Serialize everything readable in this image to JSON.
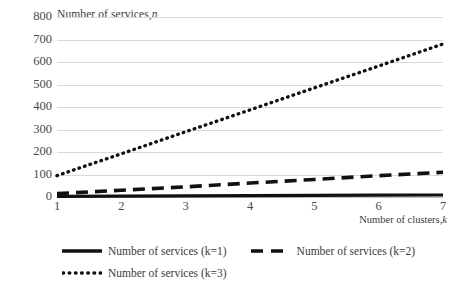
{
  "chart_data": {
    "type": "line",
    "title_plain": "Number of services,",
    "title_italic": "n",
    "xlabel_plain": "Number of clusters,",
    "xlabel_italic": "k",
    "xlabel": "Number of clusters, k",
    "ylabel": "Number of services, n",
    "x": [
      1,
      2,
      3,
      4,
      5,
      6,
      7
    ],
    "xticks": [
      "1",
      "2",
      "3",
      "4",
      "5",
      "6",
      "7"
    ],
    "yticks": [
      "0",
      "100",
      "200",
      "300",
      "400",
      "500",
      "600",
      "700",
      "800"
    ],
    "ytick_values": [
      0,
      100,
      200,
      300,
      400,
      500,
      600,
      700,
      800
    ],
    "ylim": [
      0,
      800
    ],
    "xlim": [
      1,
      7
    ],
    "grid": true,
    "legend_position": "bottom",
    "series": [
      {
        "name": "Number of services (k=1)",
        "style": "solid",
        "color": "#000000",
        "values": [
          3,
          4,
          5,
          6,
          7,
          8,
          9
        ]
      },
      {
        "name": "Number of services (k=2)",
        "style": "dashed",
        "color": "#000000",
        "values": [
          15,
          30,
          45,
          62,
          78,
          95,
          110
        ]
      },
      {
        "name": "Number of services (k=3)",
        "style": "dotted",
        "color": "#000000",
        "values": [
          95,
          192,
          290,
          387,
          485,
          582,
          680
        ]
      }
    ]
  },
  "legend": {
    "rows": [
      [
        "Number of services (k=1)",
        "Number of services (k=2)"
      ],
      [
        "Number of services (k=3)"
      ]
    ]
  }
}
